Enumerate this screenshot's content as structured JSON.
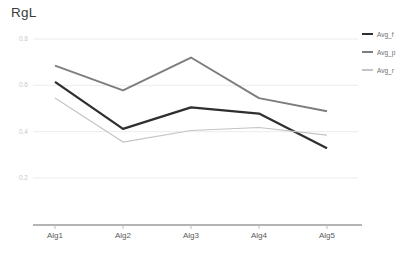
{
  "chart_data": {
    "type": "line",
    "title": "RgL",
    "xlabel": "",
    "ylabel": "",
    "categories": [
      "Alg1",
      "Alg2",
      "Alg3",
      "Alg4",
      "Alg5"
    ],
    "ylim": [
      0.1,
      0.88
    ],
    "yticks": [
      0.8,
      0.6,
      0.4,
      0.2
    ],
    "ytick_labels": [
      "0.8",
      "0.6",
      "0.4",
      "0.2"
    ],
    "grid": true,
    "grid_axis": "y",
    "legend_position": "right",
    "series": [
      {
        "name": "Avg_f",
        "color": "#2f2f2f",
        "width": 2.3,
        "values": [
          0.615,
          0.412,
          0.505,
          0.478,
          0.328
        ]
      },
      {
        "name": "Avg_p",
        "color": "#7d7d7d",
        "width": 1.9,
        "values": [
          0.685,
          0.578,
          0.72,
          0.545,
          0.488
        ]
      },
      {
        "name": "Avg_r",
        "color": "#c4c4c4",
        "width": 1.2,
        "values": [
          0.545,
          0.355,
          0.405,
          0.418,
          0.385
        ]
      }
    ],
    "colors": {
      "axis_line": "#6b6b6b",
      "grid_line": "#ececec",
      "title_text": "#3b3b3b",
      "xtick_text": "#5a5a5a",
      "ytick_text": "#c9c9c9",
      "legend_text": "#6f6f6f",
      "background": "#ffffff"
    }
  }
}
